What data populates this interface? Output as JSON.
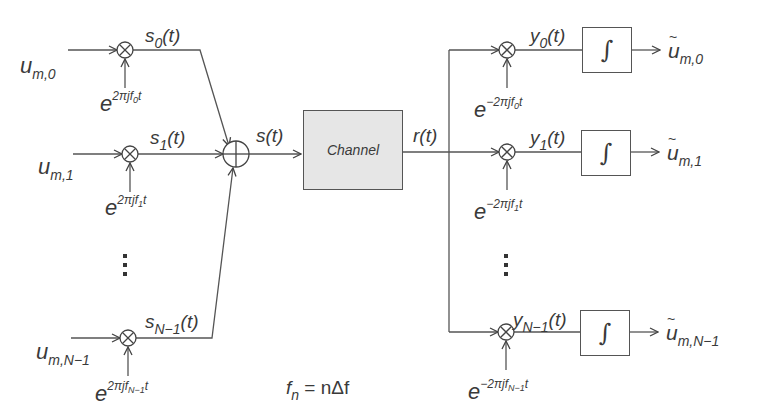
{
  "diagram": {
    "transmitter": {
      "branches": [
        {
          "input": "u",
          "input_sub": "m,0",
          "signal": "s",
          "signal_sub": "0",
          "carrier_exp": "2πjf",
          "carrier_sub": "0",
          "carrier_t": "t"
        },
        {
          "input": "u",
          "input_sub": "m,1",
          "signal": "s",
          "signal_sub": "1",
          "carrier_exp": "2πjf",
          "carrier_sub": "1",
          "carrier_t": "t"
        },
        {
          "input": "u",
          "input_sub": "m,N−1",
          "signal": "s",
          "signal_sub": "N−1",
          "carrier_exp": "2πjf",
          "carrier_sub": "N−1",
          "carrier_t": "t"
        }
      ],
      "sum_output": "s(t)"
    },
    "channel": {
      "label": "Channel",
      "output": "r(t)"
    },
    "receiver": {
      "branches": [
        {
          "signal": "y",
          "signal_sub": "0",
          "carrier_exp": "−2πjf",
          "carrier_sub": "0",
          "carrier_t": "t",
          "block": "∫",
          "output": "u",
          "output_sub": "m,0"
        },
        {
          "signal": "y",
          "signal_sub": "1",
          "carrier_exp": "−2πjf",
          "carrier_sub": "1",
          "carrier_t": "t",
          "block": "∫",
          "output": "u",
          "output_sub": "m,1"
        },
        {
          "signal": "y",
          "signal_sub": "N−1",
          "carrier_exp": "−2πjf",
          "carrier_sub": "N−1",
          "carrier_t": "t",
          "block": "∫",
          "output": "u",
          "output_sub": "m,N−1"
        }
      ]
    },
    "common": {
      "t_arg": "(t)",
      "e": "e"
    },
    "footnote": {
      "f": "f",
      "sub": "n",
      "rest": " = nΔf"
    }
  }
}
